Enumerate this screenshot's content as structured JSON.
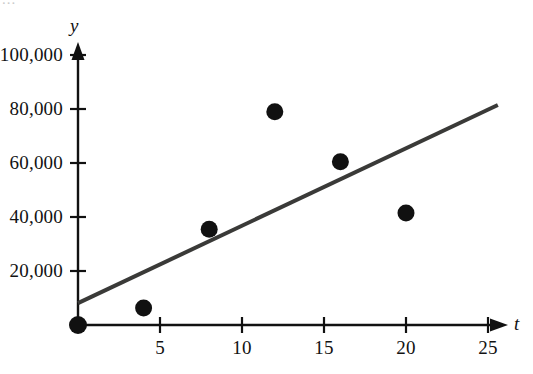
{
  "figure": {
    "background_color": "#ffffff",
    "top_crop_fragment": "...",
    "axis_color": "#111111",
    "point_color": "#111111",
    "trendline_color": "#3a3a38"
  },
  "chart_data": {
    "type": "scatter",
    "title": "",
    "subtitle": "",
    "xlabel": "t",
    "ylabel": "y",
    "xlim": [
      0,
      26.5
    ],
    "ylim": [
      0,
      108000
    ],
    "grid": false,
    "legend": "none",
    "x_ticks": [
      5,
      10,
      15,
      20,
      25
    ],
    "x_tick_labels": [
      "5",
      "10",
      "15",
      "20",
      "25"
    ],
    "y_ticks": [
      20000,
      40000,
      60000,
      80000,
      100000
    ],
    "y_tick_labels": [
      "20,000",
      "40,000",
      "60,000",
      "80,000",
      "100,000"
    ],
    "x_axis_arrow": true,
    "y_axis_arrow": true,
    "series": [
      {
        "name": "data points",
        "type": "scatter",
        "marker": "filled-circle",
        "marker_size": 11,
        "color": "#111111",
        "x": [
          0,
          4,
          8,
          12,
          16,
          20
        ],
        "values": [
          0,
          6300,
          35500,
          79000,
          60500,
          41500
        ]
      },
      {
        "name": "regression line",
        "type": "line",
        "color": "#3a3a38",
        "linewidth": 4,
        "x": [
          0,
          25.6
        ],
        "values": [
          8100,
          81500
        ]
      }
    ],
    "annotations": []
  }
}
